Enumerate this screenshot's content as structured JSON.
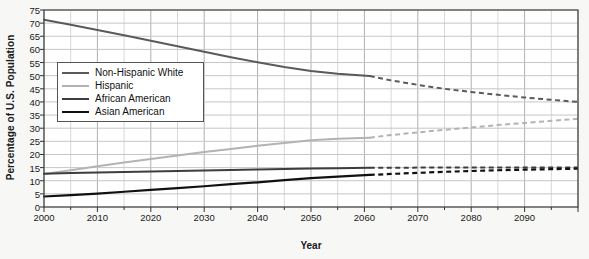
{
  "chart_data": {
    "type": "line",
    "title": "",
    "xlabel": "Year",
    "ylabel": "Percentage of U.S. Population",
    "xlim": [
      2000,
      2100
    ],
    "ylim": [
      0,
      75
    ],
    "ytick_step": 5,
    "xtick_step": 10,
    "xminor_step": 5,
    "grid": true,
    "legend_position": "upper-left-inside",
    "projection_start_year": 2061,
    "yticks": [
      0,
      5,
      10,
      15,
      20,
      25,
      30,
      35,
      40,
      45,
      50,
      55,
      60,
      65,
      70,
      75
    ],
    "xticks": [
      2000,
      2010,
      2020,
      2030,
      2040,
      2050,
      2060,
      2070,
      2080,
      2090
    ],
    "x": [
      2000,
      2005,
      2010,
      2015,
      2020,
      2025,
      2030,
      2035,
      2040,
      2045,
      2050,
      2055,
      2061,
      2065,
      2070,
      2075,
      2080,
      2085,
      2090,
      2095,
      2100
    ],
    "series": [
      {
        "name": "Non-Hispanic White",
        "color": "#5a5a5a",
        "width": 2.0,
        "values": [
          71.3,
          69.4,
          67.4,
          65.4,
          63.3,
          61.2,
          59.1,
          57.0,
          55.1,
          53.3,
          51.8,
          50.7,
          49.9,
          48.2,
          46.5,
          45.0,
          43.8,
          42.7,
          41.7,
          40.8,
          40.0
        ]
      },
      {
        "name": "Hispanic",
        "color": "#b3b3b3",
        "width": 2.0,
        "values": [
          12.6,
          14.0,
          15.5,
          16.9,
          18.3,
          19.6,
          20.9,
          22.1,
          23.3,
          24.4,
          25.4,
          26.0,
          26.4,
          27.4,
          28.4,
          29.4,
          30.3,
          31.2,
          32.0,
          32.8,
          33.6
        ]
      },
      {
        "name": "African American",
        "color": "#3d3d3d",
        "width": 2.0,
        "values": [
          12.7,
          12.9,
          13.1,
          13.3,
          13.5,
          13.7,
          13.9,
          14.1,
          14.3,
          14.5,
          14.7,
          14.8,
          14.9,
          14.9,
          15.0,
          15.0,
          15.0,
          15.0,
          15.0,
          15.0,
          15.0
        ]
      },
      {
        "name": "Asian American",
        "color": "#111111",
        "width": 2.2,
        "values": [
          4.0,
          4.5,
          5.1,
          5.8,
          6.5,
          7.2,
          7.9,
          8.7,
          9.4,
          10.2,
          11.0,
          11.6,
          12.2,
          12.6,
          13.0,
          13.4,
          13.7,
          14.0,
          14.2,
          14.4,
          14.6
        ]
      }
    ]
  },
  "axis": {
    "ylabel": "Percentage of U.S. Population",
    "xlabel": "Year"
  },
  "legend": {
    "items": [
      {
        "label": "Non-Hispanic White"
      },
      {
        "label": "Hispanic"
      },
      {
        "label": "African American"
      },
      {
        "label": "Asian American"
      }
    ]
  }
}
